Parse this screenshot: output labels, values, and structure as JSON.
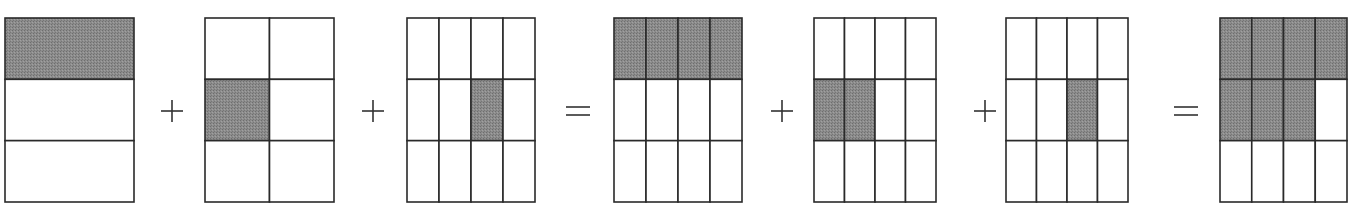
{
  "figure": {
    "colors": {
      "shaded": "#8a8a8a",
      "unshaded": "#ffffff",
      "stroke": "#2a2a2a"
    },
    "operators": [
      "+",
      "+",
      "=",
      "+",
      "+",
      "="
    ],
    "grids": [
      {
        "name": "one-third",
        "rows": 3,
        "cols": 1,
        "shaded": [
          [
            0,
            0
          ]
        ]
      },
      {
        "name": "one-sixth",
        "rows": 3,
        "cols": 2,
        "shaded": [
          [
            1,
            0
          ]
        ]
      },
      {
        "name": "one-twelfth",
        "rows": 3,
        "cols": 4,
        "shaded": [
          [
            1,
            2
          ]
        ]
      },
      {
        "name": "four-twelfths",
        "rows": 3,
        "cols": 4,
        "shaded": [
          [
            0,
            0
          ],
          [
            0,
            1
          ],
          [
            0,
            2
          ],
          [
            0,
            3
          ]
        ]
      },
      {
        "name": "two-twelfths",
        "rows": 3,
        "cols": 4,
        "shaded": [
          [
            1,
            0
          ],
          [
            1,
            1
          ]
        ]
      },
      {
        "name": "one-twelfth-b",
        "rows": 3,
        "cols": 4,
        "shaded": [
          [
            1,
            2
          ]
        ]
      },
      {
        "name": "seven-twelfths",
        "rows": 3,
        "cols": 4,
        "shaded": [
          [
            0,
            0
          ],
          [
            0,
            1
          ],
          [
            0,
            2
          ],
          [
            0,
            3
          ],
          [
            1,
            0
          ],
          [
            1,
            1
          ],
          [
            1,
            2
          ]
        ]
      }
    ]
  }
}
